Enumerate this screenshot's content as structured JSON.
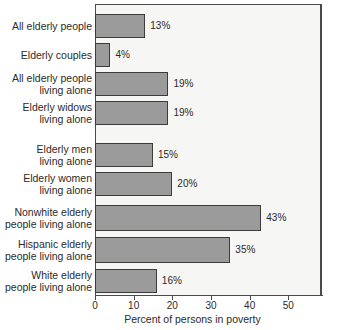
{
  "chart_data": {
    "type": "bar",
    "orientation": "horizontal",
    "title": "",
    "xlabel": "Percent of persons in poverty",
    "ylabel": "",
    "xlim": [
      0,
      57
    ],
    "ylim": null,
    "grid": false,
    "legend": null,
    "value_suffix": "%",
    "xticks": [
      0,
      10,
      20,
      30,
      40,
      50
    ],
    "xtick_labels": [
      "0",
      "10",
      "20",
      "30",
      "40",
      "50"
    ],
    "categories": [
      "All elderly people",
      "Elderly couples",
      "All elderly people\nliving alone",
      "Elderly widows\nliving alone",
      "Elderly men\nliving alone",
      "Elderly women\nliving alone",
      "Nonwhite elderly\npeople living alone",
      "Hispanic elderly\npeople living alone",
      "White elderly\npeople living alone"
    ],
    "values": [
      13,
      4,
      19,
      19,
      15,
      20,
      43,
      35,
      16
    ],
    "value_labels": [
      "13%",
      "4%",
      "19%",
      "19%",
      "15%",
      "20%",
      "43%",
      "35%",
      "16%"
    ],
    "groups": [
      {
        "name": "overall",
        "categories": [
          0,
          1,
          2,
          3
        ]
      },
      {
        "name": "by-sex-living-alone",
        "categories": [
          4,
          5
        ]
      },
      {
        "name": "by-race-living-alone",
        "categories": [
          6,
          7,
          8
        ]
      }
    ],
    "colors": {
      "bar_fill": "#9b9b9b",
      "bar_border": "#3c3c3c",
      "plot_background": "#f6f6f4",
      "axis": "#4a4a4a",
      "text": "#2b2b2b",
      "figure_background": "#ffffff"
    }
  },
  "bars": [
    {
      "label": "All elderly people",
      "value": 13,
      "value_label": "13%",
      "top": 14,
      "height": 24,
      "label_top": 21,
      "label_lines": 1
    },
    {
      "label": "Elderly couples",
      "value": 4,
      "value_label": "4%",
      "top": 43,
      "height": 24,
      "label_top": 50,
      "label_lines": 1
    },
    {
      "label": "All elderly people\nliving alone",
      "value": 19,
      "value_label": "19%",
      "top": 72,
      "height": 24,
      "label_top": 73,
      "label_lines": 2
    },
    {
      "label": "Elderly widows\nliving alone",
      "value": 19,
      "value_label": "19%",
      "top": 101,
      "height": 24,
      "label_top": 102,
      "label_lines": 2
    },
    {
      "label": "Elderly men\nliving alone",
      "value": 15,
      "value_label": "15%",
      "top": 143,
      "height": 24,
      "label_top": 144,
      "label_lines": 2
    },
    {
      "label": "Elderly women\nliving alone",
      "value": 20,
      "value_label": "20%",
      "top": 172,
      "height": 24,
      "label_top": 173,
      "label_lines": 2
    },
    {
      "label": "Nonwhite elderly\npeople living alone",
      "value": 43,
      "value_label": "43%",
      "top": 205,
      "height": 26,
      "label_top": 207,
      "label_lines": 2
    },
    {
      "label": "Hispanic elderly\npeople living alone",
      "value": 35,
      "value_label": "35%",
      "top": 237,
      "height": 26,
      "label_top": 239,
      "label_lines": 2
    },
    {
      "label": "White elderly\npeople living alone",
      "value": 16,
      "value_label": "16%",
      "top": 269,
      "height": 24,
      "label_top": 270,
      "label_lines": 2
    }
  ],
  "axis": {
    "x_title": "Percent of persons in poverty",
    "ticks": [
      {
        "value": 0,
        "label": "0"
      },
      {
        "value": 10,
        "label": "10"
      },
      {
        "value": 20,
        "label": "20"
      },
      {
        "value": 30,
        "label": "30"
      },
      {
        "value": 40,
        "label": "40"
      },
      {
        "value": 50,
        "label": "50"
      }
    ]
  }
}
